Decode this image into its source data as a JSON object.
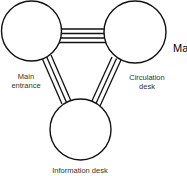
{
  "diagram": {
    "type": "relationship-bubble-diagram",
    "nodes": [
      {
        "id": "main-entrance",
        "label_line1": "Main",
        "label_line2": "entrance"
      },
      {
        "id": "circulation-desk",
        "label_line1": "Circulation",
        "label_line2": "desk"
      },
      {
        "id": "information-desk",
        "label": "Information desk"
      }
    ],
    "edges": [
      {
        "from": "main-entrance",
        "to": "circulation-desk",
        "lines": 4
      },
      {
        "from": "main-entrance",
        "to": "information-desk",
        "lines": 3
      },
      {
        "from": "circulation-desk",
        "to": "information-desk",
        "lines": 3
      }
    ],
    "cropped_text": "Ma",
    "colors": {
      "stroke": "#111111",
      "fill": "#ffffff",
      "label": "#333333"
    }
  }
}
